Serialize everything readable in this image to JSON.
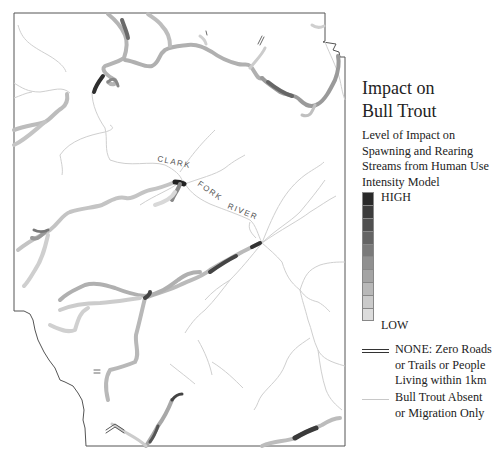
{
  "map": {
    "river_label_words": [
      "CLARK",
      "FORK",
      "RIVER"
    ],
    "boundary_color": "#444444",
    "stream_thin_color": "#cccccc"
  },
  "legend": {
    "title_line1": "Impact on",
    "title_line2": "Bull Trout",
    "subtitle_lines": [
      "Level of Impact on",
      "Spawning and Rearing",
      "Streams from Human Use",
      "Intensity Model"
    ],
    "scale": {
      "high_label": "HIGH",
      "low_label": "LOW",
      "colors": [
        "#2a2a2a",
        "#3c3c3c",
        "#505050",
        "#646464",
        "#7a7a7a",
        "#909090",
        "#a4a4a4",
        "#b8b8b8",
        "#cacaca",
        "#dcdcdc"
      ]
    },
    "none_item": {
      "lines": [
        "NONE:  Zero Roads",
        "or Trails or People",
        "Living within 1km"
      ]
    },
    "absent_item": {
      "lines": [
        "Bull Trout Absent",
        "or Migration Only"
      ]
    }
  }
}
